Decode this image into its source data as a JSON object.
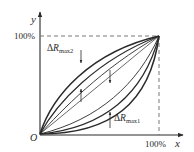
{
  "figure": {
    "axis_x_label": "x",
    "axis_y_label": "y",
    "origin_label": "O",
    "x_max_label": "100%",
    "y_max_label": "100%",
    "delta2": {
      "prefix": "Δ",
      "var": "R",
      "sub": "max2"
    },
    "delta1": {
      "prefix": "Δ",
      "var": "R",
      "sub": "max1"
    },
    "colors": {
      "line": "#2a2a2a",
      "dash": "#6a6a6a",
      "background": "#ffffff"
    }
  }
}
